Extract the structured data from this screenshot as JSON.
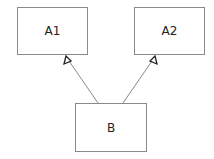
{
  "diagram": {
    "type": "uml-class-inheritance",
    "nodes": [
      {
        "id": "A1",
        "label": "A1"
      },
      {
        "id": "A2",
        "label": "A2"
      },
      {
        "id": "B",
        "label": "B"
      }
    ],
    "edges": [
      {
        "from": "B",
        "to": "A1",
        "style": "generalization"
      },
      {
        "from": "B",
        "to": "A2",
        "style": "generalization"
      }
    ],
    "colors": {
      "stroke": "#8a8a8a",
      "arrowhead": "#222222",
      "text": "#222222"
    }
  }
}
